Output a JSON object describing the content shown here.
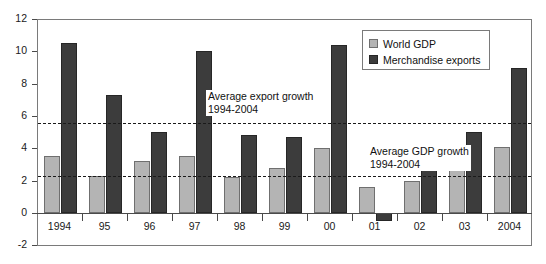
{
  "chart_data": {
    "type": "bar",
    "title": "",
    "subtitle": "",
    "xlabel": "",
    "ylabel": "",
    "ylim": [
      -2,
      12
    ],
    "yticks": [
      -2,
      0,
      2,
      4,
      6,
      8,
      10,
      12
    ],
    "ytick_labels": [
      "-2",
      "0",
      "2",
      "4",
      "6",
      "8",
      "10",
      "12"
    ],
    "grid": false,
    "legend_position": "top-right",
    "categories": [
      "1994",
      "95",
      "96",
      "97",
      "98",
      "99",
      "00",
      "01",
      "02",
      "03",
      "2004"
    ],
    "series": [
      {
        "name": "World GDP",
        "color": "#b4b4b4",
        "values": [
          3.5,
          2.3,
          3.2,
          3.5,
          2.2,
          2.8,
          4.0,
          1.6,
          2.0,
          2.7,
          4.1
        ]
      },
      {
        "name": "Merchandise exports",
        "color": "#3c3c3c",
        "values": [
          10.5,
          7.3,
          5.0,
          10.0,
          4.8,
          4.7,
          10.4,
          -0.5,
          4.1,
          5.0,
          9.0
        ]
      }
    ],
    "reference_lines": [
      {
        "name": "average-export-growth",
        "value": 5.55,
        "style": "dashed",
        "label_line1": "Average export growth",
        "label_line2": "1994-2004"
      },
      {
        "name": "average-gdp-growth",
        "value": 2.3,
        "style": "dashed",
        "label_line1": "Average GDP growth",
        "label_line2": "1994-2004"
      }
    ],
    "annotations": [
      {
        "id": "export-annotation",
        "text_line1": "Average export growth",
        "text_line2": "1994-2004"
      },
      {
        "id": "gdp-annotation",
        "text_line1": "Average GDP growth",
        "text_line2": "1994-2004"
      }
    ]
  },
  "legend": {
    "items": [
      {
        "label": "World GDP",
        "swatch": "gdp"
      },
      {
        "label": "Merchandise exports",
        "swatch": "exp"
      }
    ]
  }
}
